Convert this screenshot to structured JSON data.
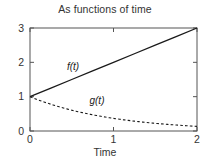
{
  "chart_data": {
    "type": "line",
    "title": "As functions of time",
    "xlabel": "Time",
    "ylabel": "",
    "xlim": [
      0,
      2
    ],
    "ylim": [
      0,
      3
    ],
    "xticks": [
      "0",
      "1",
      "2"
    ],
    "xtick_values": [
      0,
      1,
      2
    ],
    "yticks": [
      "0",
      "1",
      "2",
      "3"
    ],
    "ytick_values": [
      0,
      1,
      2,
      3
    ],
    "grid": false,
    "legend": "inline-annotations",
    "frame": "box",
    "series": [
      {
        "name": "f(t)",
        "style": "solid",
        "color": "#1a1a1a",
        "annotation": "f(t)",
        "annotation_at": [
          0.55,
          1.85
        ],
        "x": [
          0,
          0.25,
          0.5,
          0.75,
          1,
          1.25,
          1.5,
          1.75,
          2
        ],
        "values": [
          1,
          1.25,
          1.5,
          1.75,
          2,
          2.25,
          2.5,
          2.75,
          3
        ]
      },
      {
        "name": "g(t)",
        "style": "dashed",
        "color": "#1a1a1a",
        "annotation": "g(t)",
        "annotation_at": [
          0.82,
          0.86
        ],
        "x": [
          0,
          0.25,
          0.5,
          0.75,
          1,
          1.25,
          1.5,
          1.75,
          2
        ],
        "values": [
          1,
          0.779,
          0.607,
          0.472,
          0.368,
          0.287,
          0.223,
          0.174,
          0.135
        ]
      }
    ]
  },
  "colors": {
    "background": "#ffffff",
    "axis": "#555555",
    "text": "#333333",
    "line": "#1a1a1a"
  }
}
